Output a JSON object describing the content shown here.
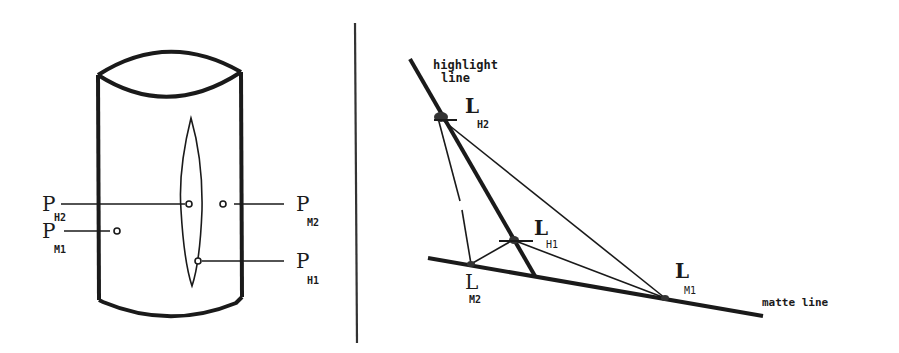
{
  "figure": {
    "left_panel": {
      "description": "cylinder with highlight region",
      "labels": {
        "ph2_main": "P",
        "ph2_sub": "H2",
        "pm1_main": "P",
        "pm1_sub": "M1",
        "pm2_main": "P",
        "pm2_sub": "M2",
        "ph1_main": "P",
        "ph1_sub": "H1"
      }
    },
    "right_panel": {
      "description": "highlight line and matte line in color space",
      "highlight_line_label_1": "highlight",
      "highlight_line_label_2": "line",
      "matte_line_label": "matte line",
      "labels": {
        "lh2_main": "L",
        "lh2_sub": "H2",
        "lh1_main": "L",
        "lh1_sub": "H1",
        "lm2_main": "L",
        "lm2_sub": "M2",
        "lm1_main": "L",
        "lm1_sub": "M1"
      }
    },
    "colors": {
      "ink": "#1a1a1a",
      "background": "#ffffff"
    }
  }
}
